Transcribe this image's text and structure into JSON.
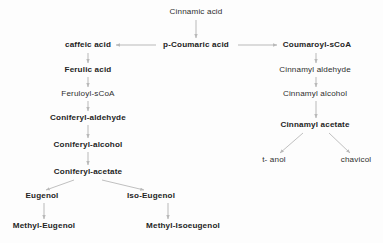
{
  "diagram": {
    "background_color": "#fdfdfd",
    "text_color": "#2b2b2b",
    "arrow_color": "#b9b9b9",
    "nodes": [
      {
        "id": "cinnamic_acid",
        "label": "Cinnamic acid",
        "x": 196,
        "y": 12,
        "weight": "plain"
      },
      {
        "id": "caffeic_acid",
        "label": "caffeic acid",
        "x": 88,
        "y": 45,
        "weight": "bold"
      },
      {
        "id": "p_coumaric_acid",
        "label": "p-Coumaric acid",
        "x": 196,
        "y": 45,
        "weight": "bold"
      },
      {
        "id": "coumaroyl_scoa",
        "label": "Coumaroyl-sCoA",
        "x": 317,
        "y": 45,
        "weight": "semi"
      },
      {
        "id": "ferulic_acid",
        "label": "Ferulic acid",
        "x": 88,
        "y": 70,
        "weight": "semi"
      },
      {
        "id": "cinnamyl_aldehyde",
        "label": "Cinnamyl aldehyde",
        "x": 315,
        "y": 70,
        "weight": "plain"
      },
      {
        "id": "feruloyl_scoa",
        "label": "Feruloyl-sCoA",
        "x": 88,
        "y": 94,
        "weight": "plain"
      },
      {
        "id": "cinnamyl_alcohol",
        "label": "Cinnamyl alcohol",
        "x": 315,
        "y": 94,
        "weight": "plain"
      },
      {
        "id": "coniferyl_aldehyde",
        "label": "Coniferyl-aldehyde",
        "x": 88,
        "y": 118,
        "weight": "semi"
      },
      {
        "id": "cinnamyl_acetate",
        "label": "Cinnamyl acetate",
        "x": 315,
        "y": 125,
        "weight": "semi"
      },
      {
        "id": "coniferyl_alcohol",
        "label": "Coniferyl-alcohol",
        "x": 88,
        "y": 145,
        "weight": "semi"
      },
      {
        "id": "coniferyl_acetate",
        "label": "Coniferyl-acetate",
        "x": 88,
        "y": 172,
        "weight": "semi"
      },
      {
        "id": "t_anol",
        "label": "t- anol",
        "x": 274,
        "y": 160,
        "weight": "plain"
      },
      {
        "id": "chavicol",
        "label": "chavicol",
        "x": 356,
        "y": 160,
        "weight": "plain"
      },
      {
        "id": "eugenol",
        "label": "Eugenol",
        "x": 42,
        "y": 196,
        "weight": "semi"
      },
      {
        "id": "iso_eugenol",
        "label": "Iso-Eugenol",
        "x": 151,
        "y": 196,
        "weight": "semi"
      },
      {
        "id": "methyl_eugenol",
        "label": "Methyl-Eugenol",
        "x": 44,
        "y": 226,
        "weight": "semi"
      },
      {
        "id": "methyl_isoeugenol",
        "label": "Methyl-Isoeugenol",
        "x": 183,
        "y": 226,
        "weight": "semi"
      }
    ],
    "edges": [
      {
        "id": "cinnamic-to-coumaric",
        "from": "cinnamic_acid",
        "to": "p_coumaric_acid",
        "kind": "vertical",
        "x1": 196,
        "y1": 20,
        "x2": 196,
        "y2": 38
      },
      {
        "id": "coumaric-to-caffeic",
        "from": "p_coumaric_acid",
        "to": "caffeic_acid",
        "kind": "horizontal",
        "x1": 156,
        "y1": 45,
        "x2": 116,
        "y2": 45
      },
      {
        "id": "coumaric-to-coumaroyl",
        "from": "p_coumaric_acid",
        "to": "coumaroyl_scoa",
        "kind": "horizontal",
        "x1": 238,
        "y1": 45,
        "x2": 277,
        "y2": 45
      },
      {
        "id": "caffeic-to-ferulic",
        "from": "caffeic_acid",
        "to": "ferulic_acid",
        "kind": "vertical",
        "x1": 88,
        "y1": 53,
        "x2": 88,
        "y2": 63
      },
      {
        "id": "ferulic-to-feruloyl",
        "from": "ferulic_acid",
        "to": "feruloyl_scoa",
        "kind": "vertical",
        "x1": 88,
        "y1": 77,
        "x2": 88,
        "y2": 87
      },
      {
        "id": "feruloyl-to-conald",
        "from": "feruloyl_scoa",
        "to": "coniferyl_aldehyde",
        "kind": "vertical",
        "x1": 88,
        "y1": 101,
        "x2": 88,
        "y2": 111
      },
      {
        "id": "conald-to-conalc",
        "from": "coniferyl_aldehyde",
        "to": "coniferyl_alcohol",
        "kind": "vertical",
        "x1": 88,
        "y1": 125,
        "x2": 88,
        "y2": 138
      },
      {
        "id": "conalc-to-conacet",
        "from": "coniferyl_alcohol",
        "to": "coniferyl_acetate",
        "kind": "vertical",
        "x1": 88,
        "y1": 152,
        "x2": 88,
        "y2": 165
      },
      {
        "id": "conacet-to-eugenol",
        "from": "coniferyl_acetate",
        "to": "eugenol",
        "kind": "diagonal",
        "x1": 74,
        "y1": 180,
        "x2": 46,
        "y2": 190
      },
      {
        "id": "conacet-to-isoeugenol",
        "from": "coniferyl_acetate",
        "to": "iso_eugenol",
        "kind": "diagonal",
        "x1": 102,
        "y1": 180,
        "x2": 144,
        "y2": 190
      },
      {
        "id": "eugenol-to-methyl",
        "from": "eugenol",
        "to": "methyl_eugenol",
        "kind": "vertical",
        "x1": 44,
        "y1": 203,
        "x2": 44,
        "y2": 219
      },
      {
        "id": "isoeugenol-to-methyl",
        "from": "iso_eugenol",
        "to": "methyl_isoeugenol",
        "kind": "vertical",
        "x1": 168,
        "y1": 203,
        "x2": 168,
        "y2": 219
      },
      {
        "id": "coumaroyl-to-cinnald",
        "from": "coumaroyl_scoa",
        "to": "cinnamyl_aldehyde",
        "kind": "vertical",
        "x1": 316,
        "y1": 53,
        "x2": 316,
        "y2": 63
      },
      {
        "id": "cinnald-to-cinnalc",
        "from": "cinnamyl_aldehyde",
        "to": "cinnamyl_alcohol",
        "kind": "vertical",
        "x1": 316,
        "y1": 77,
        "x2": 316,
        "y2": 87
      },
      {
        "id": "cinnalc-to-cinnacet",
        "from": "cinnamyl_alcohol",
        "to": "cinnamyl_acetate",
        "kind": "vertical",
        "x1": 316,
        "y1": 101,
        "x2": 316,
        "y2": 118
      },
      {
        "id": "cinnacet-to-tanol",
        "from": "cinnamyl_acetate",
        "to": "t_anol",
        "kind": "diagonal",
        "x1": 303,
        "y1": 133,
        "x2": 280,
        "y2": 153
      },
      {
        "id": "cinnacet-to-chavicol",
        "from": "cinnamyl_acetate",
        "to": "chavicol",
        "kind": "diagonal",
        "x1": 329,
        "y1": 133,
        "x2": 350,
        "y2": 153
      }
    ]
  }
}
